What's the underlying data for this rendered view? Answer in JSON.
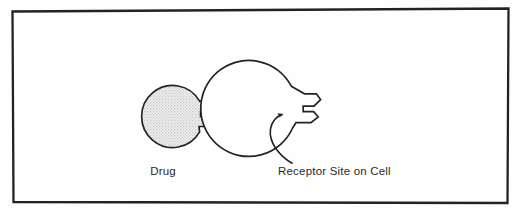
{
  "figure": {
    "background_color": "#fefefe",
    "border": {
      "name": "figure-frame",
      "color": "#232323",
      "width": 2.2,
      "skewed": true
    },
    "shapes": {
      "drug": {
        "label": "Drug",
        "kind": "filled-circle-with-key-protrusion",
        "fill_color": "#e3e3e3",
        "stroke_color": "#232323",
        "center": [
          173,
          117
        ],
        "radius": 31
      },
      "receptor": {
        "label": "Receptor Site on Cell",
        "kind": "open-circle-with-notch",
        "fill_color": "#ffffff",
        "stroke_color": "#232323",
        "center": [
          338,
          97
        ],
        "radius": 48
      },
      "pointer_arrow": {
        "name": "receptor-pointer-arrow",
        "stroke_color": "#232323",
        "from": [
          290,
          160
        ],
        "to": [
          284,
          114
        ]
      }
    },
    "labels": {
      "drug": {
        "text": "Drug",
        "x": 163,
        "y": 175,
        "anchor": "middle"
      },
      "receptor": {
        "text": "Receptor Site on Cell",
        "x": 278,
        "y": 175,
        "anchor": "start"
      }
    }
  }
}
